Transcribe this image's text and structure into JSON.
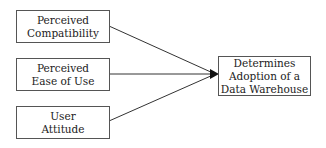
{
  "diagram": {
    "inputs": [
      {
        "id": "perceived-compatibility",
        "lines": [
          "Perceived",
          "Compatibility"
        ]
      },
      {
        "id": "perceived-ease-of-use",
        "lines": [
          "Perceived",
          "Ease of Use"
        ]
      },
      {
        "id": "user-attitude",
        "lines": [
          "User",
          "Attitude"
        ]
      }
    ],
    "output": {
      "id": "adoption",
      "lines": [
        "Determines",
        "Adoption of a",
        "Data Warehouse"
      ]
    },
    "edges": [
      {
        "from": "perceived-compatibility",
        "to": "adoption"
      },
      {
        "from": "perceived-ease-of-use",
        "to": "adoption"
      },
      {
        "from": "user-attitude",
        "to": "adoption"
      }
    ],
    "colors": {
      "stroke": "#333333",
      "text": "#222222",
      "background": "#ffffff"
    }
  }
}
